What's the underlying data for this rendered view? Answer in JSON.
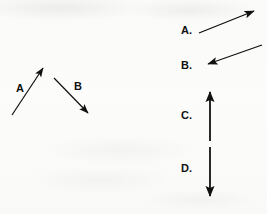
{
  "figure": {
    "background_color": "#fbfbf9",
    "ink_color": "#111111"
  },
  "stimulus": {
    "name": "two-vector-stimulus",
    "vectors": [
      {
        "id": "stimulus-vector-a",
        "label": "A",
        "label_x": 16,
        "label_y": 90,
        "tail": [
          12,
          115
        ],
        "head": [
          46,
          64
        ],
        "direction": "up-right",
        "angle_deg": 56,
        "head_style": "filled-triangle",
        "line_width": 1.2
      },
      {
        "id": "stimulus-vector-b",
        "label": "B",
        "label_x": 74,
        "label_y": 88,
        "tail": [
          54,
          78
        ],
        "head": [
          91,
          117
        ],
        "direction": "down-right",
        "angle_deg": -46,
        "head_style": "filled-triangle",
        "line_width": 1.2
      }
    ]
  },
  "choices": {
    "name": "answer-choices",
    "items": [
      {
        "id": "choice-a",
        "label": "A.",
        "label_x": 181,
        "label_y": 35,
        "tail": [
          199,
          33
        ],
        "head": [
          258,
          9
        ],
        "direction": "up-right",
        "angle_deg": 22,
        "head_style": "filled-triangle",
        "line_width": 1.3
      },
      {
        "id": "choice-b",
        "label": "B.",
        "label_x": 181,
        "label_y": 70,
        "tail": [
          262,
          45
        ],
        "head": [
          204,
          66
        ],
        "direction": "down-left",
        "angle_deg": 200,
        "head_style": "filled-triangle",
        "line_width": 1.3
      },
      {
        "id": "choice-c",
        "label": "C.",
        "label_x": 181,
        "label_y": 123,
        "tail": [
          210,
          141
        ],
        "head": [
          210,
          87
        ],
        "direction": "up",
        "angle_deg": 90,
        "head_style": "filled-triangle",
        "line_width": 1.8
      },
      {
        "id": "choice-d",
        "label": "D.",
        "label_x": 181,
        "label_y": 176,
        "tail": [
          210,
          147
        ],
        "head": [
          210,
          201
        ],
        "direction": "down",
        "angle_deg": -90,
        "head_style": "filled-triangle",
        "line_width": 1.8
      }
    ]
  }
}
